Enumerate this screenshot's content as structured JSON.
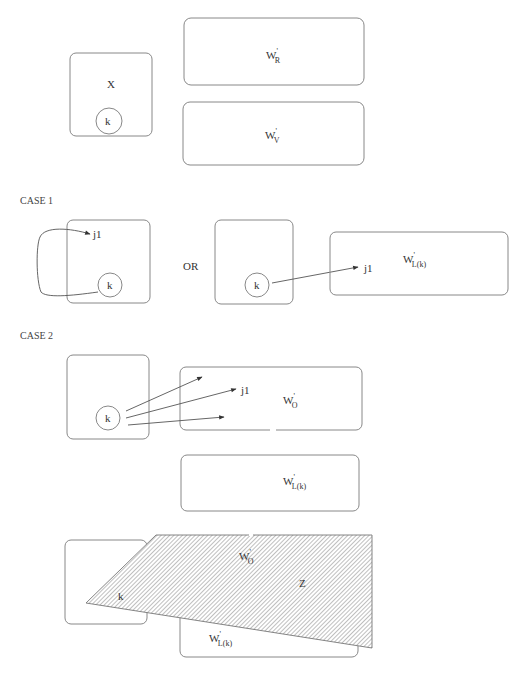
{
  "top": {
    "box_x": {
      "label": "X"
    },
    "circle_k": {
      "label": "k"
    },
    "box_wr": {
      "main": "W",
      "sup": "'",
      "sub": "R"
    },
    "box_wv": {
      "main": "W",
      "sup": "'",
      "sub": "V"
    }
  },
  "case1": {
    "title": "CASE 1",
    "left": {
      "node_j": "j1",
      "node_k": "k"
    },
    "or_label": "OR",
    "middle": {
      "node_k": "k"
    },
    "right_box": {
      "main": "W",
      "sup": "'",
      "sub": "L(k)",
      "node_j": "j1"
    }
  },
  "case2": {
    "title": "CASE 2",
    "left": {
      "node_k": "k"
    },
    "box_wo": {
      "main": "W",
      "sup": "'",
      "sub": "O",
      "node_j": "j1"
    },
    "box_wl": {
      "main": "W",
      "sup": "'",
      "sub": "L(k)"
    },
    "bottom": {
      "node_k": "k",
      "region_wo": {
        "main": "W",
        "sup": "'",
        "sub": "O"
      },
      "region_z": "Z",
      "box_wl": {
        "main": "W",
        "sup": "'",
        "sub": "L(k)"
      }
    }
  },
  "colors": {
    "stroke": "#888888",
    "hatch": "#9a9a9a",
    "text": "#333333"
  }
}
